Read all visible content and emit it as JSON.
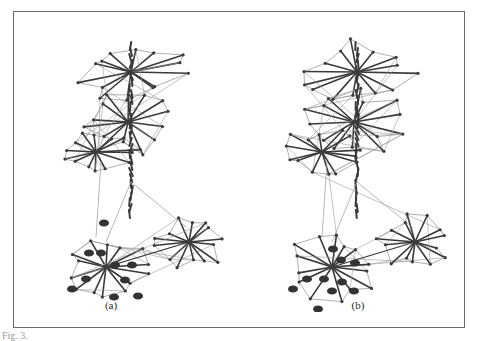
{
  "figure": {
    "panels": [
      {
        "label": "(a)",
        "highlighted_nodes": [
          [
            103,
            222
          ],
          [
            88,
            252
          ],
          [
            100,
            252
          ],
          [
            114,
            264
          ],
          [
            131,
            264
          ],
          [
            71,
            288
          ],
          [
            85,
            278
          ],
          [
            113,
            296
          ],
          [
            137,
            295
          ],
          [
            124,
            279
          ]
        ]
      },
      {
        "label": "(b)",
        "highlighted_nodes": [
          [
            332,
            248
          ],
          [
            340,
            259
          ],
          [
            354,
            262
          ],
          [
            306,
            278
          ],
          [
            292,
            288
          ],
          [
            331,
            290
          ],
          [
            353,
            290
          ],
          [
            323,
            278
          ],
          [
            341,
            281
          ],
          [
            317,
            308
          ]
        ]
      }
    ],
    "caption": "Fig. 3."
  },
  "graph": {
    "edge_color_dark": "#3a3a3a",
    "edge_color_light": "#9a9a9a",
    "node_color": "#3c3c3c",
    "clusters": [
      {
        "name": "top",
        "cx": 117,
        "cy": 60,
        "rx": 62,
        "ry": 35
      },
      {
        "name": "upper-middle",
        "cx": 114,
        "cy": 110,
        "rx": 55,
        "ry": 35
      },
      {
        "name": "middle-left",
        "cx": 82,
        "cy": 140,
        "rx": 45,
        "ry": 25
      },
      {
        "name": "bottom-left",
        "cx": 92,
        "cy": 255,
        "rx": 50,
        "ry": 38
      },
      {
        "name": "bottom-right",
        "cx": 175,
        "cy": 230,
        "rx": 40,
        "ry": 30
      }
    ]
  }
}
